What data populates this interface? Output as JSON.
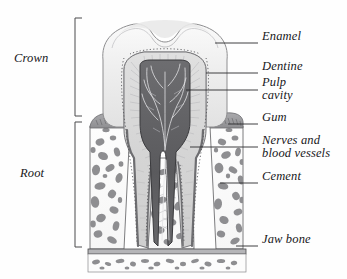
{
  "figure": {
    "background_color": "#fefefe",
    "ink_color": "#17171a"
  },
  "brackets": [
    {
      "name": "crown",
      "label": "Crown",
      "label_x": 14,
      "label_y": 58,
      "bracket_x": 75,
      "top": 18,
      "bottom": 116
    },
    {
      "name": "root",
      "label": "Root",
      "label_x": 20,
      "label_y": 173,
      "bracket_x": 75,
      "top": 122,
      "bottom": 247
    }
  ],
  "callouts": [
    {
      "name": "enamel",
      "label": "Enamel",
      "label2": "",
      "text_x": 265,
      "text_y": 35,
      "leader_x1": 215,
      "leader_y1": 43,
      "leader_x2": 258,
      "leader_y2": 43
    },
    {
      "name": "dentine",
      "label": "Dentine",
      "label2": "",
      "text_x": 265,
      "text_y": 65,
      "leader_x1": 206,
      "leader_y1": 73,
      "leader_x2": 258,
      "leader_y2": 73
    },
    {
      "name": "pulp-cavity",
      "label": "Pulp",
      "label2": "cavity",
      "text_x": 265,
      "text_y": 82,
      "leader_x1": 186,
      "leader_y1": 90,
      "leader_x2": 258,
      "leader_y2": 90
    },
    {
      "name": "gum",
      "label": "Gum",
      "label2": "",
      "text_x": 265,
      "text_y": 116,
      "leader_x1": 228,
      "leader_y1": 124,
      "leader_x2": 258,
      "leader_y2": 124
    },
    {
      "name": "nerves-and-blood-vessels",
      "label": "Nerves and",
      "label2": "blood vessels",
      "text_x": 265,
      "text_y": 139,
      "leader_x1": 190,
      "leader_y1": 147,
      "leader_x2": 258,
      "leader_y2": 147
    },
    {
      "name": "cement",
      "label": "Cement",
      "label2": "",
      "text_x": 265,
      "text_y": 175,
      "leader_x1": 220,
      "leader_y1": 183,
      "leader_x2": 258,
      "leader_y2": 183
    },
    {
      "name": "jaw-bone",
      "label": "Jaw bone",
      "label2": "",
      "text_x": 265,
      "text_y": 238,
      "leader_x1": 236,
      "leader_y1": 246,
      "leader_x2": 258,
      "leader_y2": 246
    }
  ],
  "anatomy": {
    "enamel": {
      "name": "enamel-layer",
      "fill": "#f2f2f2",
      "stroke": "#8e8e90"
    },
    "dentine": {
      "name": "dentine-layer",
      "fill": "#dcdcdc",
      "stroke": "#77777a"
    },
    "pulp": {
      "name": "pulp-cavity-region",
      "fill": "#5d5d60",
      "stroke": "#3a3a3d"
    },
    "gum": {
      "name": "gum-tissue",
      "fill": "#9b9b9e",
      "stroke": "#6a6a6d"
    },
    "cement": {
      "name": "cement-layer",
      "fill": "#c8c8c8",
      "stroke": "#6e6e71"
    },
    "bone": {
      "name": "jaw-bone-region",
      "fill": "#fbfbfb",
      "stroke": "#6a6a6d",
      "trabecula_fill": "#8c8c8f"
    },
    "cortical": {
      "name": "cortical-bone-band",
      "fill": "#b8b8bb",
      "stroke": "#4a4a4d"
    },
    "nerves": {
      "name": "nerve-vessel-filaments",
      "stroke": "#e8e8ea"
    }
  }
}
